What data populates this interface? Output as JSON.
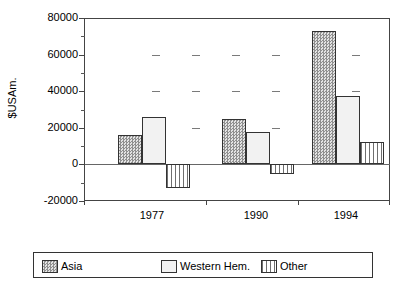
{
  "chart_data": {
    "type": "bar",
    "title": "",
    "xlabel": "",
    "ylabel": "$USAm.",
    "categories": [
      "1977",
      "1990",
      "1994"
    ],
    "series": [
      {
        "name": "Asia",
        "values": [
          16000,
          25000,
          73000
        ]
      },
      {
        "name": "Western Hem.",
        "values": [
          26000,
          17500,
          37500
        ]
      },
      {
        "name": "Other",
        "values": [
          -13000,
          -5000,
          12500
        ]
      }
    ],
    "ylim": [
      -20000,
      80000
    ],
    "ytick_labels": [
      "80000",
      "60000",
      "40000",
      "20000",
      "0",
      "-20000"
    ],
    "ytick_values": [
      80000,
      60000,
      40000,
      20000,
      0,
      -20000
    ],
    "yminor_values": [
      70000,
      50000,
      30000,
      10000,
      -10000
    ],
    "grid": "dashes",
    "legend_position": "bottom"
  },
  "legend": {
    "entries": [
      {
        "label": "Asia",
        "pattern": "checker"
      },
      {
        "label": "Western Hem.",
        "pattern": "solid"
      },
      {
        "label": "Other",
        "pattern": "vertical-stripes"
      }
    ]
  },
  "title_remnant": ""
}
